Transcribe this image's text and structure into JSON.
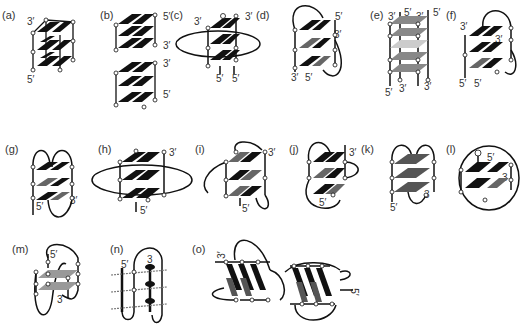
{
  "figure": {
    "background": "#ffffff",
    "colors": {
      "tetrad_dark": "#111111",
      "tetrad_gray": "#777777",
      "tetrad_light": "#a8a8a8",
      "strand": "#111111",
      "node_fill": "#ffffff"
    }
  },
  "panels": [
    {
      "id": "a",
      "label": "(a)",
      "ends": [
        "3′",
        "5′"
      ],
      "type": "tetramolecular parallel"
    },
    {
      "id": "b",
      "label": "(b)",
      "ends": [
        "5′",
        "3′",
        "3′",
        "5′"
      ],
      "type": "stacked dimer"
    },
    {
      "id": "c",
      "label": "(c)",
      "ends": [
        "3′",
        "3′",
        "5′",
        "5′"
      ],
      "type": "bimolecular"
    },
    {
      "id": "d",
      "label": "(d)",
      "ends": [
        "5′",
        "3′",
        "3′",
        "5′"
      ],
      "type": "bimolecular antiparallel"
    },
    {
      "id": "e",
      "label": "(e)",
      "ends": [
        "3′",
        "5′",
        "3′",
        "5′",
        "5′",
        "3′",
        "3′"
      ],
      "type": "tetramolecular gray"
    },
    {
      "id": "f",
      "label": "(f)",
      "ends": [
        "3′",
        "3′",
        "5′",
        "5′"
      ],
      "type": "bimolecular lateral"
    },
    {
      "id": "g",
      "label": "(g)",
      "ends": [
        "3′",
        "5′"
      ],
      "type": "unimolecular antiparallel"
    },
    {
      "id": "h",
      "label": "(h)",
      "ends": [
        "3′",
        "5′"
      ],
      "type": "unimolecular propeller"
    },
    {
      "id": "i",
      "label": "(i)",
      "ends": [
        "3′",
        "5′"
      ],
      "type": "unimolecular mixed"
    },
    {
      "id": "j",
      "label": "(j)",
      "ends": [
        "3′",
        "5′"
      ],
      "type": "unimolecular mixed"
    },
    {
      "id": "k",
      "label": "(k)",
      "ends": [
        "5′",
        "3"
      ],
      "type": "unimolecular chair"
    },
    {
      "id": "l",
      "label": "(l)",
      "ends": [
        "5′",
        "3"
      ],
      "type": "unimolecular basket"
    },
    {
      "id": "m",
      "label": "(m)",
      "ends": [
        "5′",
        "3"
      ],
      "type": "two-tetrad"
    },
    {
      "id": "n",
      "label": "(n)",
      "ends": [
        "5′",
        "3"
      ],
      "type": "two-tetrad side view"
    },
    {
      "id": "o",
      "label": "(o)",
      "ends": [
        "3′",
        "5′"
      ],
      "type": "dimeric quadruplex"
    }
  ]
}
